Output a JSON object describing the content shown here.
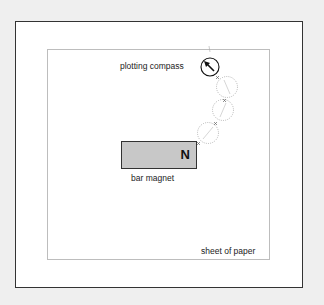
{
  "diagram": {
    "labels": {
      "plotting_compass": "plotting compass",
      "bar_magnet": "bar magnet",
      "sheet_of_paper": "sheet of paper",
      "north_pole": "N"
    },
    "colors": {
      "background": "#efefef",
      "frame_border": "#333333",
      "paper_border": "#bdbdbd",
      "magnet_fill": "#c8c8c8",
      "dotted_circle": "#999999"
    },
    "elements": [
      {
        "type": "bar-magnet",
        "pole_label": "N"
      },
      {
        "type": "plotting-compass",
        "arrow_direction": "up-left"
      },
      {
        "type": "compass-trace-positions",
        "count": 3
      },
      {
        "type": "cross-marks",
        "count": 4
      }
    ]
  }
}
